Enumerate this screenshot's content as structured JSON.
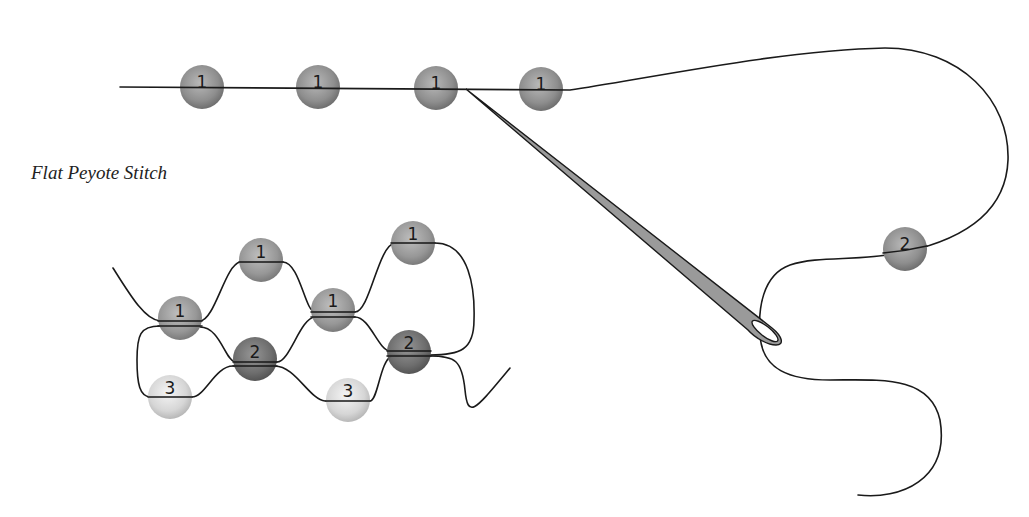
{
  "caption": "Flat Peyote Stitch",
  "colors": {
    "bead_row1": "#8f8f8f",
    "bead_row2": "#6a6a6a",
    "bead_row3": "#d6d6d6",
    "thread": "#1a1a1a",
    "needle": "#9a9a9a",
    "background": "#ffffff"
  },
  "top_diagram": {
    "beads": [
      {
        "label": "1",
        "cx": 202,
        "cy": 87
      },
      {
        "label": "1",
        "cx": 318,
        "cy": 87
      },
      {
        "label": "1",
        "cx": 436,
        "cy": 88
      },
      {
        "label": "1",
        "cx": 541,
        "cy": 89
      }
    ],
    "thread_bead": {
      "label": "2",
      "cx": 905,
      "cy": 249
    }
  },
  "stitch_diagram": {
    "beads": [
      {
        "label": "1",
        "row": 1,
        "cx": 180,
        "cy": 318
      },
      {
        "label": "1",
        "row": 1,
        "cx": 261,
        "cy": 260
      },
      {
        "label": "1",
        "row": 1,
        "cx": 333,
        "cy": 310
      },
      {
        "label": "1",
        "row": 1,
        "cx": 413,
        "cy": 243
      },
      {
        "label": "2",
        "row": 2,
        "cx": 255,
        "cy": 359
      },
      {
        "label": "2",
        "row": 2,
        "cx": 409,
        "cy": 352
      },
      {
        "label": "3",
        "row": 3,
        "cx": 170,
        "cy": 397
      },
      {
        "label": "3",
        "row": 3,
        "cx": 348,
        "cy": 400
      }
    ]
  }
}
